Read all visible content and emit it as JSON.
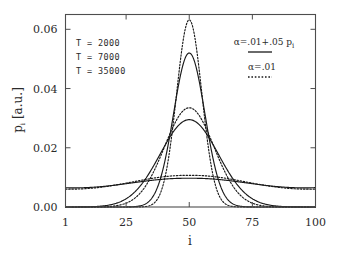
{
  "chart_data": {
    "type": "line",
    "title": "",
    "xlabel": "i",
    "ylabel": "p_i [a.u.]",
    "xlim": [
      1,
      100
    ],
    "ylim": [
      0.0,
      0.065
    ],
    "grid": false,
    "legend_position": "top-right",
    "x_ticks": [
      "1",
      "25",
      "50",
      "75",
      "100"
    ],
    "x_tick_values": [
      1,
      25,
      50,
      75,
      100
    ],
    "y_ticks": [
      "0.00",
      "0.02",
      "0.04",
      "0.06"
    ],
    "y_tick_values": [
      0.0,
      0.02,
      0.04,
      0.06
    ],
    "annotations": [
      "T = 2000",
      "T = 7000",
      "T = 35000"
    ],
    "series": [
      {
        "name": "T = 2000, alpha=.01+.05 p_i",
        "style": "solid",
        "temperature": 2000,
        "peak_x": 50,
        "peak_y": 0.052,
        "sigma": 6.2,
        "baseline": 0.0
      },
      {
        "name": "T = 2000, alpha=.01",
        "style": "dotted",
        "temperature": 2000,
        "peak_x": 50,
        "peak_y": 0.0632,
        "sigma": 5.0,
        "baseline": 0.0
      },
      {
        "name": "T = 7000, alpha=.01+.05 p_i",
        "style": "solid",
        "temperature": 7000,
        "peak_x": 50,
        "peak_y": 0.0295,
        "sigma": 11.5,
        "baseline": 0.0
      },
      {
        "name": "T = 7000, alpha=.01",
        "style": "dotted",
        "temperature": 7000,
        "peak_x": 50,
        "peak_y": 0.0335,
        "sigma": 9.8,
        "baseline": 0.0
      },
      {
        "name": "T = 35000, alpha=.01+.05 p_i",
        "style": "solid",
        "temperature": 35000,
        "peak_x": 50,
        "peak_y": 0.0138,
        "sigma": 26.5,
        "baseline": 0.0045
      },
      {
        "name": "T = 35000, alpha=.01",
        "style": "dotted",
        "temperature": 35000,
        "peak_x": 50,
        "peak_y": 0.0145,
        "sigma": 25.0,
        "baseline": 0.0042
      }
    ],
    "legend": [
      {
        "label_prefix": "α=.01+.05 p",
        "label_sub": "i",
        "style": "solid"
      },
      {
        "label_prefix": "α=.01",
        "label_sub": "",
        "style": "dotted"
      }
    ]
  },
  "axes": {
    "y_title_main": "p",
    "y_title_sub": "i",
    "y_title_unit": " [a.u.]",
    "x_title": "i"
  },
  "colors": {
    "line": "#1a1a1a",
    "axis": "#4d4d4d",
    "background": "#ffffff"
  }
}
